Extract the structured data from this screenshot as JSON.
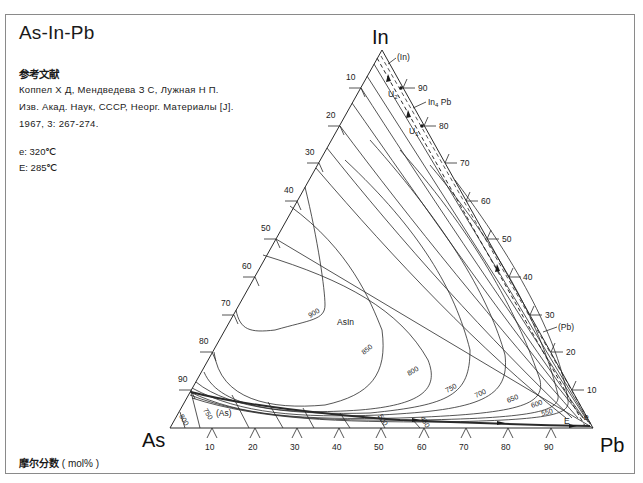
{
  "title": "As-In-Pb",
  "reference": {
    "heading": "参考文献",
    "lines": [
      "Коппел Х Д, Мендведева З С, Лужная Н П.",
      "Изв. Акад. Наук, СССР, Неорг. Материалы [J].",
      "1967, 3: 267-274."
    ]
  },
  "invariants": [
    {
      "label": "e",
      "value": "e: 320℃"
    },
    {
      "label": "E",
      "value": "E: 285℃"
    }
  ],
  "footer": {
    "label": "摩尔分数",
    "unit": "( mol% )"
  },
  "vertices": {
    "top": "In",
    "left": "As",
    "right": "Pb"
  },
  "axes": {
    "left_ticks": [
      "10",
      "20",
      "30",
      "40",
      "50",
      "60",
      "70",
      "80",
      "90"
    ],
    "right_ticks": [
      "90",
      "80",
      "70",
      "60",
      "50",
      "40",
      "30",
      "20",
      "10"
    ],
    "bottom_ticks": [
      "10",
      "20",
      "30",
      "40",
      "50",
      "60",
      "70",
      "80",
      "90"
    ]
  },
  "phase_labels": {
    "in_solid": "(In)",
    "pb_solid": "(Pb)",
    "as_solid": "(As)",
    "compound": "AsIn",
    "in4pb_main": "In",
    "in4pb_sub": "4",
    "in4pb_tail": " Pb",
    "u1_main": "U",
    "u1_sub": "1",
    "u2_main": "U",
    "u2_sub": "2",
    "e_point": "e",
    "E_point": "E"
  },
  "isotherms": [
    "900",
    "850",
    "800",
    "750",
    "700",
    "650",
    "600",
    "550",
    "500",
    "450"
  ],
  "isotherms_as_corner": [
    "800",
    "750"
  ],
  "colors": {
    "line": "#2a2a2a",
    "frame": "#8a8a8a",
    "text": "#1a1a1a"
  }
}
